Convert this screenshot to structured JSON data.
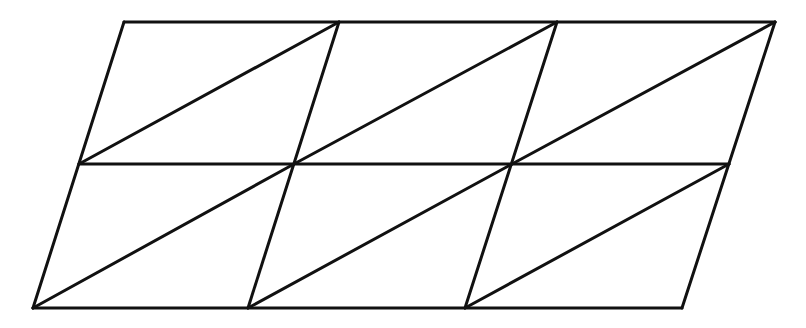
{
  "diagram": {
    "stroke_color": "#111111",
    "background_color": "#ffffff",
    "rows": 2,
    "columns": 3,
    "vertices": {
      "top": [
        [
          124,
          22
        ],
        [
          339,
          22
        ],
        [
          557,
          22
        ],
        [
          775,
          22
        ]
      ],
      "middle": [
        [
          79,
          164
        ],
        [
          294,
          164
        ],
        [
          512,
          164
        ],
        [
          729,
          164
        ]
      ],
      "bottom": [
        [
          33,
          308
        ],
        [
          248,
          308
        ],
        [
          465,
          308
        ],
        [
          682,
          308
        ]
      ]
    },
    "triangle_count": 12
  }
}
